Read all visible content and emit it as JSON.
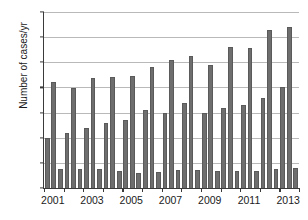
{
  "chart_data": {
    "type": "bar",
    "title": "",
    "xlabel": "",
    "ylabel": "Number of cases/yr",
    "ylim": [
      0,
      3500
    ],
    "ytick_values": [
      0,
      500,
      1000,
      1500,
      2000,
      2500,
      3000,
      3500
    ],
    "ytick_labels": [
      "0",
      "500",
      "1000",
      "1500",
      "2000",
      "2500",
      "3000",
      "3500"
    ],
    "grid": true,
    "legend": "none",
    "categories": [
      "2001",
      "2002",
      "2003",
      "2004",
      "2005",
      "2006",
      "2007",
      "2008",
      "2009",
      "2010",
      "2011",
      "2012",
      "2013"
    ],
    "xtick_labels_shown": [
      "2001",
      "",
      "2003",
      "",
      "2005",
      "",
      "2007",
      "",
      "2009",
      "",
      "2011",
      "",
      "2013"
    ],
    "bars_per_group": 3,
    "series": [
      {
        "name": "series-1",
        "values": [
          1000,
          1100,
          1200,
          1300,
          1350,
          1550,
          1500,
          1700,
          1500,
          1600,
          1650,
          1800,
          2000
        ]
      },
      {
        "name": "series-2",
        "values": [
          2100,
          1980,
          2180,
          2200,
          2230,
          2400,
          2550,
          2620,
          2450,
          2800,
          2780,
          3150,
          3200
        ]
      },
      {
        "name": "series-3",
        "values": [
          380,
          370,
          370,
          340,
          300,
          320,
          350,
          350,
          330,
          330,
          340,
          380,
          400
        ]
      }
    ],
    "bar_color": "#6e6e6e",
    "axis_color": "#3a3a3a",
    "grid_color": "#b9b9b9"
  }
}
